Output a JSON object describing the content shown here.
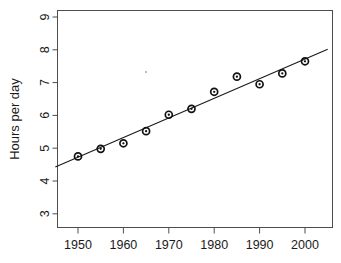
{
  "chart_data": {
    "type": "scatter",
    "title": "",
    "subtitle": "",
    "xlabel": "",
    "ylabel": "Hours per day",
    "x": [
      1950,
      1955,
      1960,
      1965,
      1970,
      1975,
      1980,
      1985,
      1990,
      1995,
      2000
    ],
    "values": [
      4.75,
      4.98,
      5.15,
      5.52,
      6.02,
      6.2,
      6.72,
      7.18,
      6.95,
      7.28,
      7.65
    ],
    "series": [
      {
        "name": "Hours per day",
        "values": [
          4.75,
          4.98,
          5.15,
          5.52,
          6.02,
          6.2,
          6.72,
          7.18,
          6.95,
          7.28,
          7.65
        ]
      }
    ],
    "xlim": [
      1945,
      2005
    ],
    "ylim": [
      2.7,
      9.35
    ],
    "xticks": [
      1950,
      1960,
      1970,
      1980,
      1990,
      2000
    ],
    "xtick_labels": [
      "1950",
      "1960",
      "1970",
      "1980",
      "1990",
      "2000"
    ],
    "yticks": [
      3,
      4,
      5,
      6,
      7,
      8,
      9
    ],
    "ytick_labels": [
      "3",
      "4",
      "5",
      "6",
      "7",
      "8",
      "9"
    ],
    "grid": false,
    "legend": false,
    "legend_position": "none",
    "trendline": {
      "type": "linear",
      "x_start": 1945,
      "y_start": 4.43,
      "x_end": 2005,
      "y_end": 8.02
    },
    "marker_style": "open-circle-with-dot",
    "colors": {
      "point": "#111111",
      "line": "#1a1a1a",
      "axis": "#4d4d4d",
      "text": "#1a1a1a",
      "background": "#ffffff"
    }
  }
}
